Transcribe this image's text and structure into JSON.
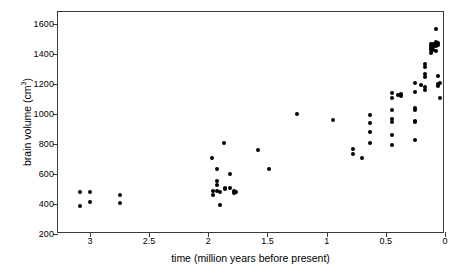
{
  "chart_data": {
    "type": "scatter",
    "title": "",
    "xlabel": "time (million years before present)",
    "ylabel": "brain volume (cm³)",
    "ylabel_base": "brain volume (cm",
    "ylabel_sup": "3",
    "ylabel_tail": ")",
    "xlim": [
      3.27,
      0.0
    ],
    "ylim": [
      200,
      1680
    ],
    "x_reversed": true,
    "grid": false,
    "legend": null,
    "xticks": [
      3,
      2.5,
      2,
      1.5,
      1,
      0.5,
      0
    ],
    "xticklabels": [
      "3",
      "2.5",
      "2",
      "1.5",
      "1",
      "0.5",
      "0"
    ],
    "yticks": [
      200,
      400,
      600,
      800,
      1000,
      1200,
      1400,
      1600
    ],
    "yticklabels": [
      "200",
      "400",
      "600",
      "800",
      "1000",
      "1200",
      "1400",
      "1600"
    ],
    "marker": "filled-circle",
    "marker_color": "#000000",
    "points": [
      [
        3.08,
        478
      ],
      [
        3.08,
        390
      ],
      [
        3.0,
        480
      ],
      [
        3.0,
        415
      ],
      [
        2.75,
        462
      ],
      [
        2.75,
        410
      ],
      [
        1.97,
        710
      ],
      [
        1.96,
        490
      ],
      [
        1.96,
        460
      ],
      [
        1.93,
        635
      ],
      [
        1.93,
        555
      ],
      [
        1.93,
        530
      ],
      [
        1.93,
        487
      ],
      [
        1.9,
        483
      ],
      [
        1.9,
        395
      ],
      [
        1.87,
        805
      ],
      [
        1.86,
        510
      ],
      [
        1.86,
        500
      ],
      [
        1.82,
        600
      ],
      [
        1.82,
        505
      ],
      [
        1.78,
        490
      ],
      [
        1.78,
        475
      ],
      [
        1.77,
        482
      ],
      [
        1.58,
        757
      ],
      [
        1.49,
        632
      ],
      [
        1.25,
        998
      ],
      [
        0.95,
        960
      ],
      [
        0.78,
        765
      ],
      [
        0.78,
        735
      ],
      [
        0.7,
        705
      ],
      [
        0.63,
        995
      ],
      [
        0.63,
        940
      ],
      [
        0.63,
        880
      ],
      [
        0.63,
        805
      ],
      [
        0.45,
        1140
      ],
      [
        0.45,
        1105
      ],
      [
        0.45,
        1030
      ],
      [
        0.45,
        965
      ],
      [
        0.45,
        950
      ],
      [
        0.45,
        860
      ],
      [
        0.45,
        795
      ],
      [
        0.4,
        1130
      ],
      [
        0.37,
        1135
      ],
      [
        0.37,
        1120
      ],
      [
        0.25,
        1205
      ],
      [
        0.25,
        1145
      ],
      [
        0.25,
        1040
      ],
      [
        0.25,
        1025
      ],
      [
        0.25,
        955
      ],
      [
        0.25,
        948
      ],
      [
        0.25,
        825
      ],
      [
        0.2,
        1195
      ],
      [
        0.17,
        1335
      ],
      [
        0.17,
        1315
      ],
      [
        0.17,
        1270
      ],
      [
        0.17,
        1245
      ],
      [
        0.17,
        1180
      ],
      [
        0.17,
        1160
      ],
      [
        0.12,
        1465
      ],
      [
        0.12,
        1455
      ],
      [
        0.12,
        1440
      ],
      [
        0.12,
        1430
      ],
      [
        0.12,
        1410
      ],
      [
        0.1,
        1470
      ],
      [
        0.1,
        1460
      ],
      [
        0.1,
        1450
      ],
      [
        0.1,
        1425
      ],
      [
        0.08,
        1570
      ],
      [
        0.08,
        1480
      ],
      [
        0.08,
        1470
      ],
      [
        0.08,
        1455
      ],
      [
        0.08,
        1420
      ],
      [
        0.06,
        1475
      ],
      [
        0.06,
        1460
      ],
      [
        0.06,
        1255
      ],
      [
        0.06,
        1200
      ],
      [
        0.06,
        1185
      ],
      [
        0.04,
        1210
      ],
      [
        0.04,
        1110
      ]
    ]
  }
}
